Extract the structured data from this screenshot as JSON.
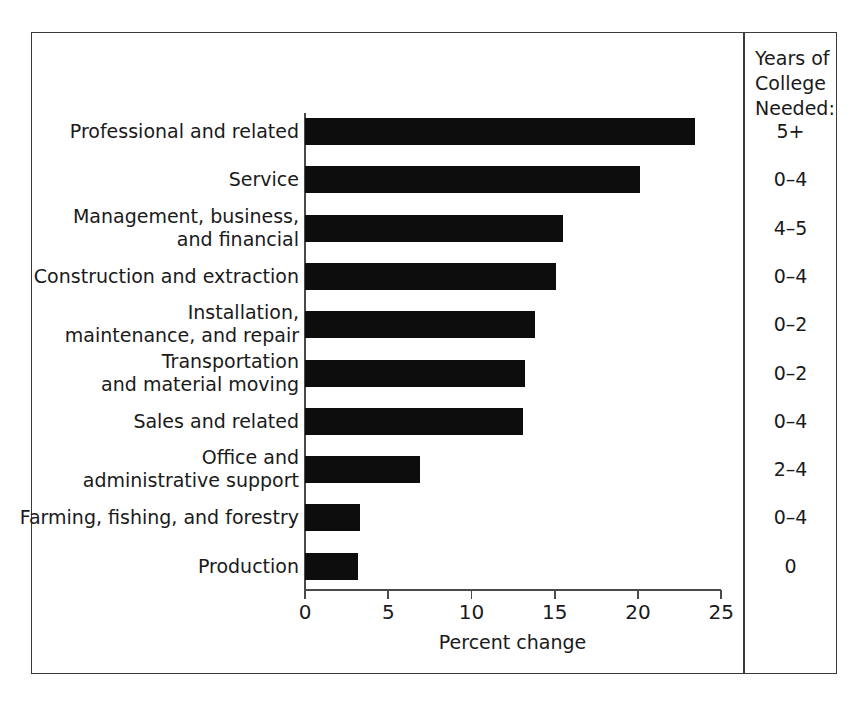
{
  "figure": {
    "x_axis_title": "Percent change",
    "years_column_header": "Years of\nCollege\nNeeded:"
  },
  "axis": {
    "ticks": [
      "0",
      "5",
      "10",
      "15",
      "20",
      "25"
    ]
  },
  "rows": [
    {
      "label": "Professional and related",
      "value": 23.4,
      "years": "5+"
    },
    {
      "label": "Service",
      "value": 20.1,
      "years": "0–4"
    },
    {
      "label": "Management, business,\nand financial",
      "value": 15.5,
      "years": "4–5"
    },
    {
      "label": "Construction and extraction",
      "value": 15.1,
      "years": "0–4"
    },
    {
      "label": "Installation,\nmaintenance, and repair",
      "value": 13.8,
      "years": "0–2"
    },
    {
      "label": "Transportation\nand material moving",
      "value": 13.2,
      "years": "0–2"
    },
    {
      "label": "Sales and related",
      "value": 13.1,
      "years": "0–4"
    },
    {
      "label": "Office and\nadministrative support",
      "value": 6.9,
      "years": "2–4"
    },
    {
      "label": "Farming, fishing, and forestry",
      "value": 3.3,
      "years": "0–4"
    },
    {
      "label": "Production",
      "value": 3.2,
      "years": "0"
    }
  ],
  "chart_data": {
    "type": "bar",
    "orientation": "horizontal",
    "title": "",
    "xlabel": "Percent change",
    "ylabel": "",
    "xlim": [
      0,
      25
    ],
    "xticks": [
      0,
      5,
      10,
      15,
      20,
      25
    ],
    "grid": false,
    "legend": null,
    "bar_color": "#0d0d0d",
    "categories": [
      "Professional and related",
      "Service",
      "Management, business, and financial",
      "Construction and extraction",
      "Installation, maintenance, and repair",
      "Transportation and material moving",
      "Sales and related",
      "Office and administrative support",
      "Farming, fishing, and forestry",
      "Production"
    ],
    "values": [
      23.4,
      20.1,
      15.5,
      15.1,
      13.8,
      13.2,
      13.1,
      6.9,
      3.3,
      3.2
    ],
    "annotations": {
      "column_header": "Years of College Needed:",
      "column_values": [
        "5+",
        "0–4",
        "4–5",
        "0–4",
        "0–2",
        "0–2",
        "0–4",
        "2–4",
        "0–4",
        "0"
      ]
    }
  }
}
